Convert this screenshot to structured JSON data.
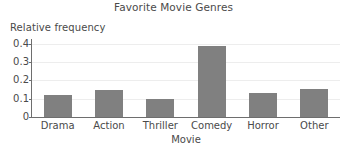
{
  "chart_data": {
    "type": "bar",
    "title": "Favorite Movie Genres",
    "xlabel": "Movie",
    "ylabel": "Relative frequency",
    "categories": [
      "Drama",
      "Action",
      "Thriller",
      "Comedy",
      "Horror",
      "Other"
    ],
    "values": [
      0.12,
      0.15,
      0.1,
      0.39,
      0.13,
      0.155
    ],
    "ylim": [
      0,
      0.42
    ],
    "yticks": [
      0,
      0.1,
      0.2,
      0.3,
      0.4
    ],
    "ytick_labels": [
      "0",
      "0.1",
      "0.2",
      "0.3",
      "0.4"
    ],
    "grid": "horizontal",
    "legend": "none",
    "bar_color": "#808080",
    "gridline_color": "#ededed",
    "axis_color": "#6e6e6e",
    "text_color": "#4a4a4a"
  }
}
